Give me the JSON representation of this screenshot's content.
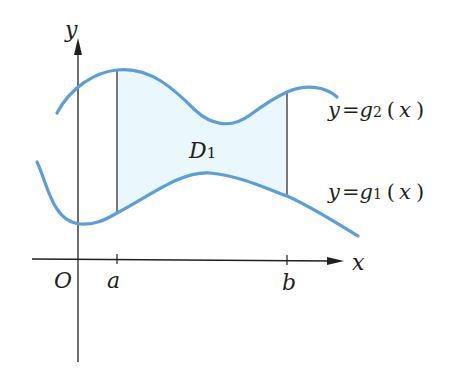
{
  "diagram": {
    "colors": {
      "curve": "#5a9fdc",
      "fill": "#eaf7fc",
      "axis": "#231f20",
      "text": "#231f20"
    },
    "axes": {
      "x_label": "x",
      "y_label": "y",
      "origin_label": "O"
    },
    "ticks": [
      {
        "label": "a"
      },
      {
        "label": "b"
      }
    ],
    "region": {
      "label_main": "D",
      "label_sub": "1"
    },
    "curves": {
      "upper": {
        "lhs": "y",
        "eq": "=",
        "fn": "g",
        "sub": "2",
        "open": "(",
        "arg": "x",
        "close": ")"
      },
      "lower": {
        "lhs": "y",
        "eq": "=",
        "fn": "g",
        "sub": "1",
        "open": "(",
        "arg": "x",
        "close": ")"
      }
    }
  }
}
